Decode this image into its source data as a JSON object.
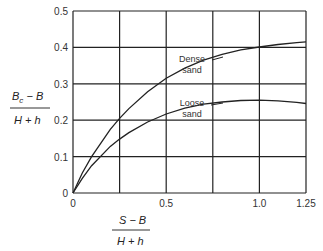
{
  "chart_data": {
    "type": "line",
    "title": "",
    "xlabel": {
      "numerator": "S − B",
      "denominator": "H + h"
    },
    "ylabel": {
      "numerator": "B",
      "subscript": "c",
      "numerator_rest": " − B",
      "denominator": "H + h"
    },
    "xlim": [
      0,
      1.25
    ],
    "ylim": [
      0,
      0.5
    ],
    "grid": true,
    "x_ticks": [
      "0",
      "0.5",
      "1.0",
      "1.25"
    ],
    "x_gridlines": [
      0,
      0.25,
      0.5,
      0.75,
      1.0,
      1.25
    ],
    "y_ticks": [
      "0",
      "0.1",
      "0.2",
      "0.3",
      "0.4",
      "0.5"
    ],
    "series": [
      {
        "name": "Dense sand",
        "label_lines": [
          "Dense",
          "sand"
        ],
        "x": [
          0,
          0.05,
          0.1,
          0.2,
          0.25,
          0.3,
          0.4,
          0.5,
          0.6,
          0.7,
          0.8,
          0.9,
          1.0,
          1.1,
          1.2,
          1.25
        ],
        "y": [
          0,
          0.055,
          0.1,
          0.175,
          0.205,
          0.232,
          0.278,
          0.315,
          0.343,
          0.365,
          0.381,
          0.393,
          0.401,
          0.408,
          0.413,
          0.415
        ]
      },
      {
        "name": "Loose sand",
        "label_lines": [
          "Loose",
          "sand"
        ],
        "x": [
          0,
          0.05,
          0.1,
          0.2,
          0.25,
          0.3,
          0.4,
          0.5,
          0.6,
          0.7,
          0.8,
          0.9,
          1.0,
          1.1,
          1.2,
          1.25
        ],
        "y": [
          0,
          0.04,
          0.075,
          0.128,
          0.148,
          0.166,
          0.195,
          0.217,
          0.233,
          0.244,
          0.25,
          0.254,
          0.255,
          0.253,
          0.249,
          0.246
        ]
      }
    ],
    "legend": "inline annotations with leader lines"
  }
}
